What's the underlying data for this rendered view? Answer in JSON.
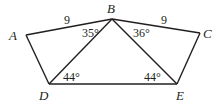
{
  "figure": {
    "vertices": {
      "A": {
        "label": "A",
        "x": 26,
        "y": 35
      },
      "B": {
        "label": "B",
        "x": 112,
        "y": 19
      },
      "C": {
        "label": "C",
        "x": 200,
        "y": 33
      },
      "D": {
        "label": "D",
        "x": 49,
        "y": 84
      },
      "E": {
        "label": "E",
        "x": 177,
        "y": 84
      }
    },
    "side_labels": {
      "AB": "9",
      "BC": "9"
    },
    "angle_labels": {
      "ABD": "35°",
      "CBE": "36°",
      "BDE": "44°",
      "BED": "44°"
    },
    "stroke_color": "#231f20"
  }
}
